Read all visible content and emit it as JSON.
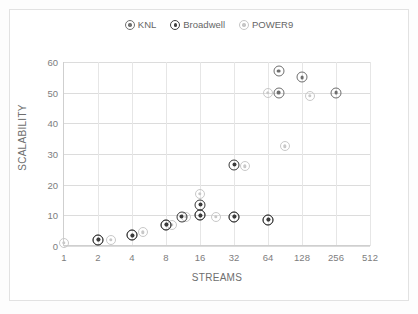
{
  "chart_data": {
    "type": "scatter",
    "title": "",
    "xlabel": "STREAMS",
    "ylabel": "SCALABILITY",
    "xscale": "log2",
    "xlim": [
      1,
      512
    ],
    "ylim": [
      0,
      60
    ],
    "x_ticks": [
      "1",
      "2",
      "4",
      "8",
      "16",
      "32",
      "64",
      "128",
      "256",
      "512"
    ],
    "y_ticks": [
      "0",
      "10",
      "20",
      "30",
      "40",
      "50",
      "60"
    ],
    "grid": "both",
    "legend_position": "top-center",
    "series": [
      {
        "name": "KNL",
        "color": "#6e6e6e",
        "points": [
          {
            "x": 2,
            "y": 2.0
          },
          {
            "x": 4,
            "y": 3.5
          },
          {
            "x": 8,
            "y": 7.0
          },
          {
            "x": 16,
            "y": 10.0
          },
          {
            "x": 32,
            "y": 9.5
          },
          {
            "x": 64,
            "y": 8.5
          },
          {
            "x": 80,
            "y": 57.0
          },
          {
            "x": 80,
            "y": 50.0
          },
          {
            "x": 128,
            "y": 55.0
          },
          {
            "x": 256,
            "y": 50.0
          }
        ]
      },
      {
        "name": "Broadwell",
        "color": "#3a3a3a",
        "points": [
          {
            "x": 2,
            "y": 2.0
          },
          {
            "x": 4,
            "y": 3.5
          },
          {
            "x": 8,
            "y": 7.0
          },
          {
            "x": 11,
            "y": 9.5
          },
          {
            "x": 16,
            "y": 13.5
          },
          {
            "x": 16,
            "y": 10.0
          },
          {
            "x": 32,
            "y": 26.5
          },
          {
            "x": 32,
            "y": 9.5
          },
          {
            "x": 64,
            "y": 8.5
          }
        ]
      },
      {
        "name": "POWER9",
        "color": "#c8c8c8",
        "points": [
          {
            "x": 1,
            "y": 1.0
          },
          {
            "x": 2.6,
            "y": 2.0
          },
          {
            "x": 5,
            "y": 4.5
          },
          {
            "x": 9,
            "y": 7.0
          },
          {
            "x": 12,
            "y": 9.5
          },
          {
            "x": 16,
            "y": 17.0
          },
          {
            "x": 22,
            "y": 9.5
          },
          {
            "x": 40,
            "y": 26.0
          },
          {
            "x": 90,
            "y": 32.5
          },
          {
            "x": 64,
            "y": 50.0
          },
          {
            "x": 150,
            "y": 49.0
          }
        ]
      }
    ]
  },
  "legend": {
    "items": [
      {
        "label": "KNL",
        "key": "knl"
      },
      {
        "label": "Broadwell",
        "key": "broadwell"
      },
      {
        "label": "POWER9",
        "key": "power9"
      }
    ]
  },
  "axes": {
    "x_title": "STREAMS",
    "y_title": "SCALABILITY"
  }
}
